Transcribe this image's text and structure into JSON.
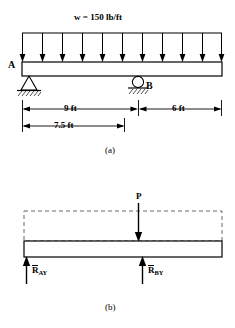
{
  "figure": {
    "panels": [
      {
        "caption": "(a)",
        "type": "beam-loading-diagram",
        "load_label": "w = 150 lb/ft",
        "support_a_label": "A",
        "support_b_label": "B",
        "support_a_type": "pin-support",
        "support_b_type": "roller-support",
        "distributed_load_arrow_count": 11,
        "dimensions": [
          {
            "name": "a-to-b",
            "text": "9 ft"
          },
          {
            "name": "b-to-end",
            "text": "6 ft"
          },
          {
            "name": "a-to-resultant",
            "text": "7.5 ft"
          }
        ]
      },
      {
        "caption": "(b)",
        "type": "free-body-diagram",
        "point_load_label": "P",
        "reactions": [
          {
            "name": "reaction-a",
            "symbol": "R",
            "subscript": "AY"
          },
          {
            "name": "reaction-b",
            "symbol": "R",
            "subscript": "BY"
          }
        ]
      }
    ]
  },
  "colors": {
    "line": "#000000",
    "background": "#ffffff",
    "dashed": "#555555"
  }
}
